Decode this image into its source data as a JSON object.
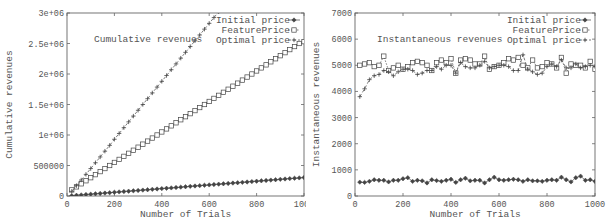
{
  "chart_data": [
    {
      "type": "line",
      "title": "Cumulative revenues",
      "xlabel": "Number of Trials",
      "ylabel": "Cumulative revenues",
      "xlim": [
        0,
        1000
      ],
      "ylim": [
        0,
        3000000
      ],
      "xticks": [
        "0",
        "200",
        "400",
        "600",
        "800",
        "1000"
      ],
      "yticks": [
        "0",
        "500000",
        "1e+06",
        "1.5e+06",
        "2e+06",
        "2.5e+06",
        "3e+06"
      ],
      "grid": false,
      "legend_position": "top-right",
      "legend": [
        "Initial price",
        "FeaturePrice",
        "Optimal price"
      ],
      "x": [
        20,
        40,
        60,
        80,
        100,
        120,
        140,
        160,
        180,
        200,
        220,
        240,
        260,
        280,
        300,
        320,
        340,
        360,
        380,
        400,
        420,
        440,
        460,
        480,
        500,
        520,
        540,
        560,
        580,
        600,
        620,
        640,
        660,
        680,
        700,
        720,
        740,
        760,
        780,
        800,
        820,
        840,
        860,
        880,
        900,
        920,
        940,
        960,
        980,
        1000
      ],
      "series": [
        {
          "name": "Initial price",
          "marker": "diamond",
          "values": [
            6000,
            12000,
            18000,
            24000,
            30000,
            36000,
            42000,
            48000,
            54000,
            61000,
            67000,
            73000,
            79000,
            85000,
            91000,
            97000,
            103000,
            109000,
            115000,
            121000,
            127000,
            133000,
            139000,
            145000,
            152000,
            158000,
            164000,
            170000,
            176000,
            182000,
            188000,
            194000,
            200000,
            206000,
            212000,
            218000,
            224000,
            230000,
            236000,
            243000,
            249000,
            255000,
            261000,
            267000,
            273000,
            279000,
            285000,
            291000,
            297000,
            303000
          ]
        },
        {
          "name": "FeaturePrice",
          "marker": "square",
          "values": [
            100000,
            150000,
            200000,
            250000,
            300000,
            350000,
            400000,
            450000,
            500000,
            550000,
            600000,
            650000,
            700000,
            750000,
            800000,
            850000,
            900000,
            950000,
            1000000,
            1050000,
            1100000,
            1150000,
            1200000,
            1250000,
            1300000,
            1350000,
            1400000,
            1450000,
            1500000,
            1550000,
            1600000,
            1650000,
            1700000,
            1750000,
            1800000,
            1850000,
            1900000,
            1950000,
            2000000,
            2050000,
            2100000,
            2150000,
            2200000,
            2250000,
            2300000,
            2350000,
            2400000,
            2450000,
            2500000,
            2530000
          ]
        },
        {
          "name": "Optimal price",
          "marker": "plus",
          "values": [
            77000,
            170000,
            262000,
            355000,
            450000,
            545000,
            640000,
            735000,
            830000,
            930000,
            1025000,
            1120000,
            1215000,
            1310000,
            1405000,
            1500000,
            1595000,
            1690000,
            1785000,
            1880000,
            1975000,
            2070000,
            2165000,
            2260000,
            2355000,
            2450000,
            2545000,
            2640000,
            2735000,
            2830000,
            2925000,
            3020000,
            3115000,
            3210000,
            3305000,
            3400000,
            3495000,
            3590000,
            3685000,
            3780000,
            3875000,
            3970000,
            4065000,
            4160000,
            4255000,
            4350000,
            4445000,
            4540000,
            4635000,
            4730000
          ]
        }
      ]
    },
    {
      "type": "line",
      "title": "Instantaneous revenues",
      "xlabel": "Number of Trials",
      "ylabel": "Instantaneous revenues",
      "xlim": [
        0,
        1000
      ],
      "ylim": [
        0,
        7000
      ],
      "xticks": [
        "0",
        "200",
        "400",
        "600",
        "800",
        "1000"
      ],
      "yticks": [
        "0",
        "1000",
        "2000",
        "3000",
        "4000",
        "5000",
        "6000",
        "7000"
      ],
      "grid": false,
      "legend_position": "top-right",
      "legend": [
        "Initial price",
        "FeaturePrice",
        "Optimal price"
      ],
      "x": [
        20,
        40,
        60,
        80,
        100,
        120,
        140,
        160,
        180,
        200,
        220,
        240,
        260,
        280,
        300,
        320,
        340,
        360,
        380,
        400,
        420,
        440,
        460,
        480,
        500,
        520,
        540,
        560,
        580,
        600,
        620,
        640,
        660,
        680,
        700,
        720,
        740,
        760,
        780,
        800,
        820,
        840,
        860,
        880,
        900,
        920,
        940,
        960,
        980,
        1000
      ],
      "series": [
        {
          "name": "Initial price",
          "marker": "diamond",
          "values": [
            530,
            520,
            560,
            620,
            600,
            600,
            540,
            600,
            600,
            660,
            700,
            560,
            600,
            580,
            500,
            620,
            590,
            560,
            600,
            640,
            520,
            620,
            680,
            580,
            600,
            600,
            500,
            620,
            720,
            620,
            600,
            620,
            640,
            620,
            560,
            620,
            580,
            580,
            560,
            600,
            620,
            600,
            720,
            620,
            540,
            700,
            760,
            600,
            620,
            560
          ]
        },
        {
          "name": "FeaturePrice",
          "marker": "square",
          "values": [
            5000,
            5050,
            5100,
            4950,
            5000,
            5350,
            4800,
            4900,
            5000,
            4850,
            4950,
            5100,
            5150,
            5100,
            5000,
            4800,
            5100,
            5200,
            5100,
            5250,
            4700,
            5200,
            5250,
            5200,
            5050,
            5050,
            5350,
            4850,
            4950,
            5000,
            5100,
            5250,
            5200,
            5300,
            5000,
            4900,
            5200,
            4900,
            4950,
            5100,
            5050,
            4900,
            5300,
            4700,
            5050,
            5000,
            5000,
            4900,
            5150,
            4850
          ]
        },
        {
          "name": "Optimal price",
          "marker": "plus",
          "values": [
            3800,
            4100,
            4450,
            4600,
            4650,
            4800,
            4750,
            4600,
            4750,
            4850,
            4850,
            4800,
            4650,
            4700,
            4800,
            4800,
            4950,
            4850,
            5000,
            5000,
            4700,
            5100,
            4950,
            4900,
            4900,
            5000,
            5150,
            4900,
            4950,
            5000,
            5000,
            4950,
            4800,
            4800,
            5400,
            4850,
            4750,
            4650,
            4700,
            4950,
            5050,
            4950,
            5200,
            4900,
            4900,
            5050,
            4900,
            4950,
            5000,
            4950
          ]
        }
      ]
    }
  ],
  "left": {
    "inset_title": "Cumulative revenues",
    "xlabel": "Number of Trials",
    "ylabel": "Cumulative revenues",
    "legend": [
      "Initial price",
      "FeaturePrice",
      "Optimal price"
    ]
  },
  "right": {
    "inset_title": "Instantaneous revenues",
    "xlabel": "Number of Trials",
    "ylabel": "Instantaneous revenues",
    "legend": [
      "Initial price",
      "FeaturePrice",
      "Optimal price"
    ]
  },
  "colors": {
    "line": "#444444",
    "axis": "#666666",
    "text": "#555555"
  }
}
